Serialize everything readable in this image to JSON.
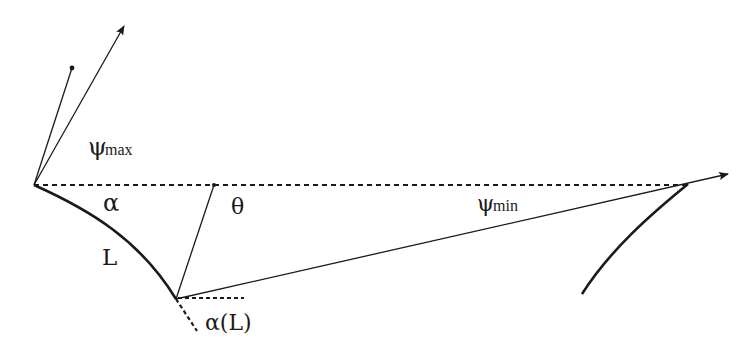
{
  "labels": {
    "psi_max_sym": "ψ",
    "psi_max_sub": "max",
    "alpha": "α",
    "theta": "θ",
    "L": "L",
    "psi_min_sym": "ψ",
    "psi_min_sub": "min",
    "alpha_L": "α(L)"
  },
  "colors": {
    "stroke": "#1a1a1a",
    "background": "#ffffff"
  }
}
